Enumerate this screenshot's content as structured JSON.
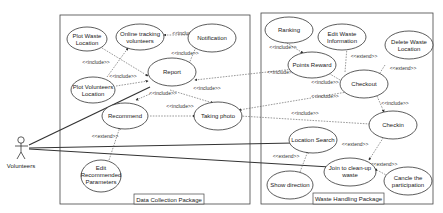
{
  "actor": {
    "label": "Volunteers"
  },
  "packages": {
    "data_collection": {
      "label": "Data Collection Package"
    },
    "waste_handling": {
      "label": "Waste Handling Package"
    }
  },
  "use_cases": {
    "plot_waste_location": [
      "Plot Waste",
      "Location"
    ],
    "online_tracking": [
      "Online tracking",
      "volunteers"
    ],
    "notification": [
      "Notification"
    ],
    "report": [
      "Report"
    ],
    "plot_volunteers_location": [
      "Plot Volunteers",
      "Location"
    ],
    "recommend": [
      "Recommend"
    ],
    "taking_photo": [
      "Taking photo"
    ],
    "edit_recommended_parameters": [
      "Edit",
      "Recommended",
      "Parameters"
    ],
    "ranking": [
      "Ranking"
    ],
    "edit_waste_information": [
      "Edit Waste",
      "Information"
    ],
    "delete_waste_location": [
      "Delete Waste",
      "Location"
    ],
    "points_reward": [
      "Points Reward"
    ],
    "checkout": [
      "Checkout"
    ],
    "checkin": [
      "Checkin"
    ],
    "location_search": [
      "Location Search"
    ],
    "show_direction": [
      "Show direction"
    ],
    "join_cleanup": [
      "Join to clean-up",
      "waste"
    ],
    "cancel_participation": [
      "Cancle the",
      "participation"
    ]
  },
  "relations": {
    "include": "<<include>>",
    "extend": "<<extend>>"
  }
}
